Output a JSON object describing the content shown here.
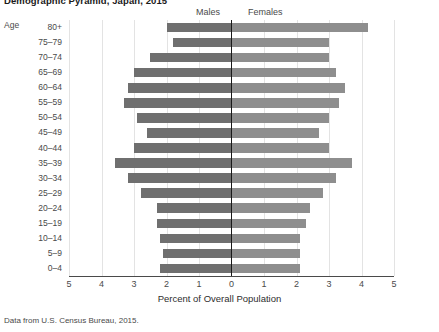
{
  "title": "Demographic Pyramid, Japan, 2015",
  "legend": {
    "males": "Males",
    "females": "Females"
  },
  "axes": {
    "y_title": "Age",
    "x_title": "Percent of Overall Population",
    "x_ticks": [
      "5",
      "4",
      "3",
      "2",
      "1",
      "0",
      "1",
      "2",
      "3",
      "4",
      "5"
    ]
  },
  "source": "Data from U.S. Census Bureau, 2015.",
  "colors": {
    "male_bar": "#6f6f6f",
    "female_bar": "#8e8e8e",
    "center_axis": "#1a1a1a",
    "gridline": "#e3e3e3"
  },
  "chart_data": {
    "type": "bar",
    "subtype": "population-pyramid",
    "title": "Demographic Pyramid, Japan, 2015",
    "xlabel": "Percent of Overall Population",
    "ylabel": "Age",
    "xlim": [
      -5,
      5
    ],
    "xtick_values": [
      5,
      4,
      3,
      2,
      1,
      0,
      1,
      2,
      3,
      4,
      5
    ],
    "grid": true,
    "legend_position": "top-center",
    "orientation": "horizontal",
    "categories": [
      "80+",
      "75–79",
      "70–74",
      "65–69",
      "60–64",
      "55–59",
      "50–54",
      "45–49",
      "40–44",
      "35–39",
      "30–34",
      "25–29",
      "20–24",
      "15–19",
      "10–14",
      "5–9",
      "0–4"
    ],
    "series": [
      {
        "name": "Males",
        "direction": "left",
        "color": "#6f6f6f",
        "values": [
          2.0,
          1.8,
          2.5,
          3.0,
          3.2,
          3.3,
          2.9,
          2.6,
          3.0,
          3.6,
          3.2,
          2.8,
          2.3,
          2.3,
          2.2,
          2.1,
          2.2
        ]
      },
      {
        "name": "Females",
        "direction": "right",
        "color": "#8e8e8e",
        "values": [
          4.2,
          3.0,
          3.0,
          3.2,
          3.5,
          3.3,
          3.0,
          2.7,
          3.0,
          3.7,
          3.2,
          2.8,
          2.4,
          2.3,
          2.1,
          2.1,
          2.1
        ]
      }
    ]
  }
}
